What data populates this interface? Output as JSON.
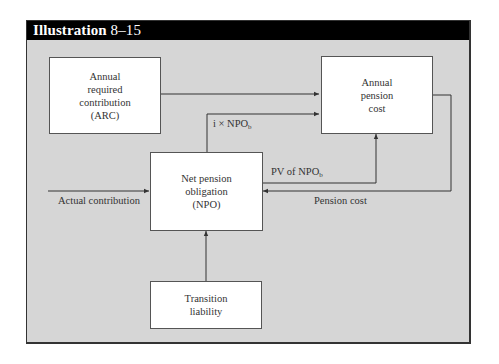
{
  "header": {
    "title": "Illustration",
    "number": "8–15"
  },
  "boxes": {
    "arc": {
      "lines": [
        "Annual",
        "required",
        "contribution",
        "(ARC)"
      ]
    },
    "annual_pension_cost": {
      "lines": [
        "Annual",
        "pension",
        "cost"
      ]
    },
    "npo": {
      "lines": [
        "Net pension",
        "obligation",
        "(NPO)"
      ]
    },
    "transition": {
      "lines": [
        "Transition",
        "liability"
      ]
    }
  },
  "arrows": {
    "interest": {
      "prefix": "i × NPO",
      "subscript": "b"
    },
    "pv": {
      "prefix": "PV of NPO",
      "subscript": "b"
    },
    "actual_contribution": "Actual contribution",
    "pension_cost": "Pension cost"
  },
  "colors": {
    "header_bg": "#000000",
    "frame_bg": "#d6d6d6",
    "box_bg": "#ffffff",
    "line": "#333333"
  }
}
